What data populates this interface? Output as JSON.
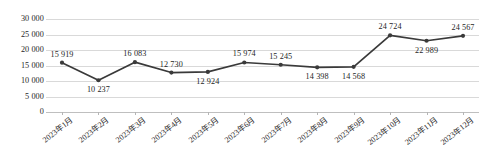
{
  "chart_data": {
    "type": "line",
    "title": "",
    "subtitle": "",
    "xlabel": "",
    "ylabel": "",
    "ylim": [
      0,
      30000
    ],
    "grid": true,
    "legend": false,
    "legend_position": "none",
    "series_color": "#3a3a3a",
    "marker": "circle",
    "data_labels": true,
    "categories": [
      "2023年1月",
      "2023年2月",
      "2023年3月",
      "2023年4月",
      "2023年5月",
      "2023年6月",
      "2023年7月",
      "2023年8月",
      "2023年9月",
      "2023年10月",
      "2023年11月",
      "2023年12月"
    ],
    "values": [
      15919,
      10237,
      16083,
      12730,
      12924,
      15974,
      15245,
      14398,
      14568,
      24724,
      22989,
      24567
    ],
    "value_labels": [
      "15 919",
      "10 237",
      "16 083",
      "12 730",
      "12 924",
      "15 974",
      "15 245",
      "14 398",
      "14 568",
      "24 724",
      "22 989",
      "24 567"
    ],
    "label_placement": [
      "above",
      "below",
      "above",
      "above",
      "below",
      "above",
      "above",
      "below",
      "below",
      "above",
      "below",
      "above"
    ],
    "yticks": [
      30000,
      25000,
      20000,
      15000,
      10000,
      5000,
      0
    ],
    "ytick_labels": [
      "30 000",
      "25 000",
      "20 000",
      "15 000",
      "10 000",
      "5 000",
      "0"
    ]
  }
}
